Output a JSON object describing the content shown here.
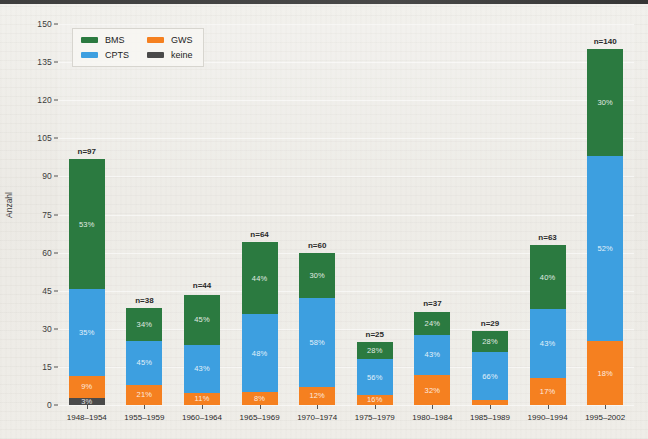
{
  "chart_data": {
    "type": "bar",
    "subtype": "stacked-bar",
    "title": "",
    "xlabel": "",
    "ylabel": "Anzahl",
    "ylim": [
      0,
      150
    ],
    "yticks": [
      0,
      15,
      30,
      45,
      60,
      75,
      90,
      105,
      120,
      135,
      150
    ],
    "grid": true,
    "legend_position": "top-left",
    "categories": [
      "1948–1954",
      "1955–1959",
      "1960–1964",
      "1965–1969",
      "1970–1974",
      "1975–1979",
      "1980–1984",
      "1985–1989",
      "1990–1994",
      "1995–2002"
    ],
    "totals": [
      97,
      38,
      44,
      64,
      60,
      25,
      37,
      29,
      63,
      140
    ],
    "total_labels": [
      "n=97",
      "n=38",
      "n=44",
      "n=64",
      "n=60",
      "n=25",
      "n=37",
      "n=29",
      "n=63",
      "n=140"
    ],
    "series": [
      {
        "name": "BMS",
        "color": "#2b7a40",
        "percent": [
          53,
          34,
          45,
          44,
          30,
          28,
          24,
          28,
          40,
          30
        ],
        "percent_labels": [
          "53%",
          "34%",
          "45%",
          "44%",
          "30%",
          "28%",
          "24%",
          "28%",
          "40%",
          "30%"
        ],
        "values": [
          51.4,
          12.9,
          19.8,
          28.2,
          18.0,
          7.0,
          8.9,
          8.1,
          25.2,
          42.0
        ]
      },
      {
        "name": "CPTS",
        "color": "#3d9fe0",
        "percent": [
          35,
          45,
          43,
          48,
          58,
          56,
          43,
          66,
          43,
          52
        ],
        "percent_labels": [
          "35%",
          "45%",
          "43%",
          "48%",
          "58%",
          "56%",
          "43%",
          "66%",
          "43%",
          "52%"
        ],
        "values": [
          33.9,
          17.1,
          18.9,
          30.7,
          34.8,
          14.0,
          15.9,
          19.1,
          27.1,
          72.8
        ]
      },
      {
        "name": "GWS",
        "color": "#f58020",
        "percent": [
          9,
          21,
          11,
          8,
          12,
          16,
          32,
          6,
          17,
          18
        ],
        "percent_labels": [
          "9%",
          "21%",
          "11%",
          "8%",
          "12%",
          "16%",
          "32%",
          "",
          "17%",
          "18%"
        ],
        "values": [
          8.7,
          8.0,
          4.8,
          5.1,
          7.2,
          4.0,
          11.8,
          1.8,
          10.7,
          25.2
        ]
      },
      {
        "name": "keine",
        "color": "#4a4a4a",
        "percent": [
          3,
          0,
          0,
          0,
          0,
          0,
          0,
          0,
          0,
          0
        ],
        "percent_labels": [
          "3%",
          "",
          "",
          "",
          "",
          "",
          "",
          "",
          "",
          ""
        ],
        "values": [
          2.9,
          0,
          0,
          0,
          0,
          0,
          0,
          0,
          0,
          0
        ]
      }
    ]
  },
  "legend": {
    "items": [
      {
        "label": "BMS",
        "color": "#2b7a40"
      },
      {
        "label": "GWS",
        "color": "#f58020"
      },
      {
        "label": "CPTS",
        "color": "#3d9fe0"
      },
      {
        "label": "keine",
        "color": "#4a4a4a"
      }
    ]
  },
  "axis": {
    "y_title": "Anzahl",
    "y_ticks": [
      "0",
      "15",
      "30",
      "45",
      "60",
      "75",
      "90",
      "105",
      "120",
      "135",
      "150"
    ]
  }
}
